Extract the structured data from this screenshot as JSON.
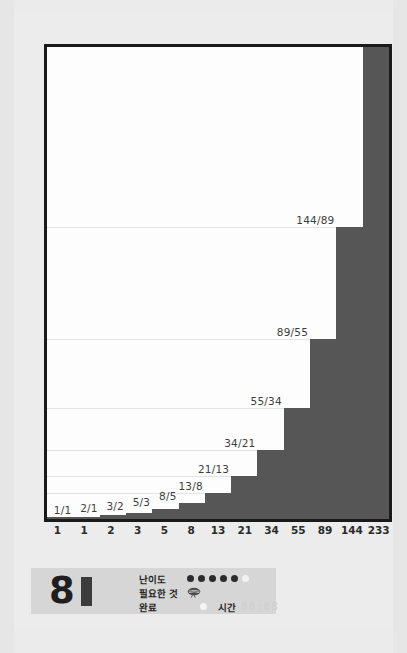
{
  "chart_data": {
    "type": "bar",
    "title": "",
    "xlabel": "",
    "ylabel": "",
    "grid": true,
    "legend": "none",
    "ylim": [
      0,
      233
    ],
    "categories": [
      "1",
      "1",
      "2",
      "3",
      "5",
      "8",
      "13",
      "21",
      "34",
      "55",
      "89",
      "144",
      "233"
    ],
    "values": [
      1,
      1,
      2,
      3,
      5,
      8,
      13,
      21,
      34,
      55,
      89,
      144,
      233
    ],
    "bar_labels": [
      "",
      "1/1",
      "2/1",
      "3/2",
      "5/3",
      "8/5",
      "13/8",
      "21/13",
      "34/21",
      "55/34",
      "89/55",
      "144/89",
      "233/144"
    ],
    "bar_color": "#565656",
    "gridlines": [
      13,
      21,
      34,
      55,
      89,
      144
    ]
  },
  "footer": {
    "score": "8",
    "difficulty": {
      "label": "난이도",
      "filled": 5,
      "total": 6
    },
    "needed": {
      "label": "필요한 것",
      "icon": "brain-icon"
    },
    "done": {
      "label": "완료"
    },
    "time": {
      "label": "시간",
      "value": "88:88"
    }
  }
}
